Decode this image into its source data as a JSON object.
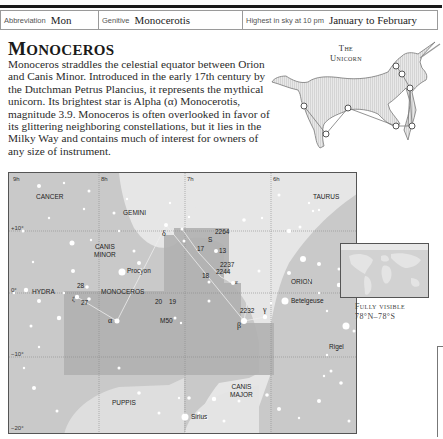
{
  "infobar": {
    "abbreviation_label": "Abbreviation",
    "abbreviation_value": "Mon",
    "genitive_label": "Genitive",
    "genitive_value": "Monocerotis",
    "highest_label": "Highest in sky at 10 pm",
    "highest_value": "January to February"
  },
  "title": {
    "first": "M",
    "rest": "ONOCEROS"
  },
  "body_text": "Monoceros straddles the celestial equator between Orion and Canis Minor. Introduced in the early 17th century by the Dutchman Petrus Plancius, it represents the mythical unicorn. Its brightest star is Alpha (α) Monocerotis, magnitude 3.9. Monoceros is often overlooked in favor of its glittering neighboring constellations, but it lies in the Milky Way and contains much of interest for owners of any size of instrument.",
  "figure": {
    "line1": "The",
    "line2": "Unicorn"
  },
  "map": {
    "ra_labels": [
      "9h",
      "8h",
      "7h",
      "6h"
    ],
    "dec_labels": [
      "+10°",
      "0°",
      "−10°",
      "−20°"
    ],
    "constellations": {
      "cancer": "CANCER",
      "gemini": "GEMINI",
      "canis_minor_1": "CANIS",
      "canis_minor_2": "MINOR",
      "hydra": "HYDRA",
      "monoceros": "MONOCEROS",
      "orion": "ORION",
      "taurus": "TAURUS",
      "puppis": "PUPPIS",
      "canis_major_1": "CANIS",
      "canis_major_2": "MAJOR"
    },
    "stars": {
      "procyon": "Procyon",
      "betelgeuse": "Betelgeuse",
      "rigel": "Rigel",
      "sirius": "Sirius",
      "alpha": "α",
      "beta": "β",
      "gamma": "γ",
      "delta": "δ",
      "epsilon": "ε",
      "zeta": "ζ",
      "s": "S",
      "n13": "13",
      "n17": "17",
      "n18": "18",
      "n19": "19",
      "n20": "20",
      "n27": "27",
      "n28": "28"
    },
    "objects": {
      "ngc2264": "2264",
      "ngc2237": "2237",
      "ngc2244": "2244",
      "ngc2232": "2232",
      "m50": "M50"
    }
  },
  "visibility": {
    "line1": "Fully visible",
    "line2": "78°N–78°S"
  },
  "colors": {
    "map_background": "#c9c9c9",
    "milky_way": "#e6e6e6",
    "monoceros_region": "#b0b0b0",
    "text": "#222222"
  }
}
